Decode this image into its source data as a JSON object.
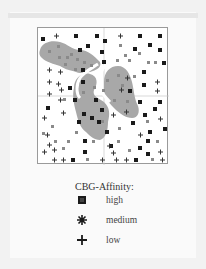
{
  "figure": {
    "legend": {
      "title": "CBG-Affinity:",
      "items": [
        {
          "label": "high",
          "symbol": "filled-square-icon"
        },
        {
          "label": "medium",
          "symbol": "asterisk-icon"
        },
        {
          "label": "low",
          "symbol": "plus-icon"
        }
      ]
    },
    "colors": {
      "region_fill": "#a8a8a8",
      "high": "#1a1a1a",
      "medium": "#777777",
      "low": "#333333",
      "frame": "#9a9a9a"
    }
  }
}
